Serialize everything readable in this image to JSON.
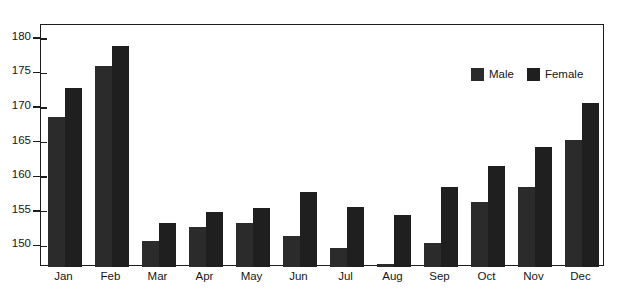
{
  "chart_data": {
    "type": "bar",
    "title": "",
    "subtitle": "",
    "xlabel": "",
    "ylabel": "",
    "categories": [
      "Jan",
      "Feb",
      "Mar",
      "Apr",
      "May",
      "Jun",
      "Jul",
      "Aug",
      "Sep",
      "Oct",
      "Nov",
      "Dec"
    ],
    "series": [
      {
        "name": "Male",
        "color": "#2b2b2b",
        "values": [
          168.7,
          176.0,
          150.8,
          152.8,
          153.3,
          151.5,
          149.8,
          147.5,
          150.4,
          156.4,
          158.5,
          165.3
        ]
      },
      {
        "name": "Female",
        "color": "#1f1f1f",
        "values": [
          172.9,
          179.0,
          153.4,
          155.0,
          155.5,
          157.8,
          155.7,
          154.5,
          158.5,
          161.6,
          164.3,
          170.7
        ]
      }
    ],
    "yticks": [
      150,
      155,
      160,
      165,
      170,
      175,
      180
    ],
    "ylim": [
      147.0,
      182.0
    ],
    "grid": false,
    "legend_position": "top-right",
    "legend_entries": [
      "Male",
      "Female"
    ]
  },
  "legend": {
    "male_label": "Male",
    "female_label": "Female",
    "male_color": "#2b2b2b",
    "female_color": "#1f1f1f"
  },
  "caption": {
    "text": ""
  }
}
